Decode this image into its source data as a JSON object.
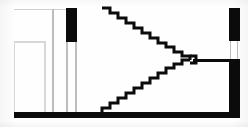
{
  "drawing": {
    "title": "Stair Plan",
    "type": "architectural-floor-plan",
    "description": "Monochrome scanned architectural floor plan of a stairwell: two opposing run stairs meeting at a central landing point, flanked by solid poché walls with door openings.",
    "colors": {
      "wall_fill": "#0b0b0b",
      "paper": "#ffffff",
      "construction_line": "#c9c9c9",
      "thin_partition": "#bdbdbd"
    }
  },
  "canvas": {
    "width": 248,
    "height": 127
  },
  "elements": {
    "top_wall": {
      "name": "top-wall",
      "x": 14,
      "y": 7,
      "width": 226,
      "height": 2,
      "fill": "#c9c9c9"
    },
    "bottom_wall": {
      "name": "bottom-wall",
      "x": 14,
      "y": 112,
      "width": 226,
      "height": 6,
      "fill": "#0b0b0b"
    },
    "left_construction_h1": {
      "name": "upper-construction-line",
      "x": 14,
      "y": 9,
      "width": 60,
      "height": 1
    },
    "left_construction_h2": {
      "name": "lower-construction-line",
      "x": 14,
      "y": 41,
      "width": 31,
      "height": 2
    },
    "left_construction_v1": {
      "name": "left-jamb-line",
      "x": 14,
      "y": 41,
      "width": 1,
      "height": 72
    },
    "left_construction_v2": {
      "name": "interior-partition-line",
      "x": 44,
      "y": 41,
      "width": 2,
      "height": 72
    },
    "partition_a": {
      "name": "partition-wall-a",
      "x": 52,
      "y": 9,
      "width": 2,
      "height": 104
    },
    "partition_b": {
      "name": "partition-wall-b",
      "x": 66,
      "y": 42,
      "width": 2,
      "height": 71
    },
    "partition_c": {
      "name": "partition-wall-c",
      "x": 75,
      "y": 42,
      "width": 2,
      "height": 71
    },
    "left_pier": {
      "name": "left-wall-pier",
      "x": 66,
      "y": 8,
      "width": 11,
      "height": 34,
      "fill": "#0b0b0b"
    },
    "right_pier_upper": {
      "name": "right-wall-pier-upper",
      "x": 229,
      "y": 8,
      "width": 11,
      "height": 33,
      "fill": "#0b0b0b"
    },
    "right_pier_lower": {
      "name": "right-wall-pier-lower",
      "x": 229,
      "y": 59,
      "width": 11,
      "height": 59,
      "fill": "#0b0b0b"
    },
    "right_opening": {
      "name": "right-wall-door-opening",
      "x": 229,
      "y": 41,
      "width": 11,
      "height": 18,
      "fill": "#ffffff"
    },
    "right_opening_jamb_a": {
      "name": "right-opening-jamb-a",
      "x": 230,
      "y": 41,
      "width": 1,
      "height": 18
    },
    "right_opening_jamb_b": {
      "name": "right-opening-jamb-b",
      "x": 237,
      "y": 41,
      "width": 1,
      "height": 18
    },
    "landing_rail": {
      "name": "center-landing-rail",
      "x": 193,
      "y": 59,
      "width": 46,
      "height": 3,
      "fill": "#0b0b0b"
    }
  },
  "stairs": {
    "upper_run": {
      "name": "upper-stair-run",
      "label": "Upper flight — descending left to right",
      "step_count": 11,
      "start": {
        "x": 102,
        "y": 7
      },
      "end": {
        "x": 190,
        "y": 58
      },
      "tread": 8,
      "riser": 4.7,
      "path": "M 102 8 L 110 8 L 110 13 L 118 13 L 118 18 L 126 18 L 126 23 L 134 23 L 134 28 L 142 28 L 142 33 L 150 33 L 150 38 L 158 38 L 158 43 L 166 43 L 166 47 L 174 47 L 174 52 L 182 52 L 182 56 L 190 56 L 190 60"
    },
    "lower_run": {
      "name": "lower-stair-run",
      "label": "Lower flight — ascending left to right",
      "step_count": 11,
      "start": {
        "x": 102,
        "y": 112
      },
      "end": {
        "x": 190,
        "y": 62
      },
      "tread": 8,
      "riser": 4.7,
      "path": "M 102 112 L 102 108 L 110 108 L 110 103 L 118 103 L 118 98 L 126 98 L 126 93 L 134 93 L 134 88 L 142 88 L 142 83 L 150 83 L 150 78 L 158 78 L 158 73 L 166 73 L 166 68 L 174 68 L 174 64 L 182 64 L 182 60 L 190 60"
    },
    "landing_nose": {
      "name": "landing-nose",
      "path": "M 190 56 L 196 56 L 196 63 L 190 63"
    },
    "stroke_width": 3
  },
  "annotations": {
    "visible_text": []
  }
}
